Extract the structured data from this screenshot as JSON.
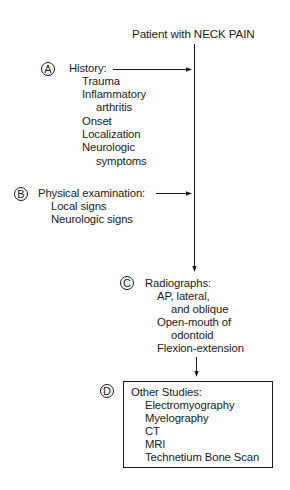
{
  "title": "Patient with NECK PAIN",
  "steps": {
    "a": {
      "marker": "A",
      "heading": "History:",
      "items": [
        "Trauma",
        "Inflammatory",
        "arthritis",
        "Onset",
        "Localization",
        "Neurologic",
        "symptoms"
      ]
    },
    "b": {
      "marker": "B",
      "heading": "Physical examination:",
      "items": [
        "Local signs",
        "Neurologic signs"
      ]
    },
    "c": {
      "marker": "C",
      "heading": "Radiographs:",
      "items": [
        "AP, lateral,",
        "and oblique",
        "Open-mouth of",
        "odontoid",
        "Flexion-extension"
      ]
    },
    "d": {
      "marker": "D",
      "heading": "Other Studies:",
      "items": [
        "Electromyography",
        "Myelography",
        "CT",
        "MRI",
        "Technetium Bone Scan"
      ]
    }
  },
  "colors": {
    "ink": "#1a1a1a",
    "background": "#ffffff"
  }
}
